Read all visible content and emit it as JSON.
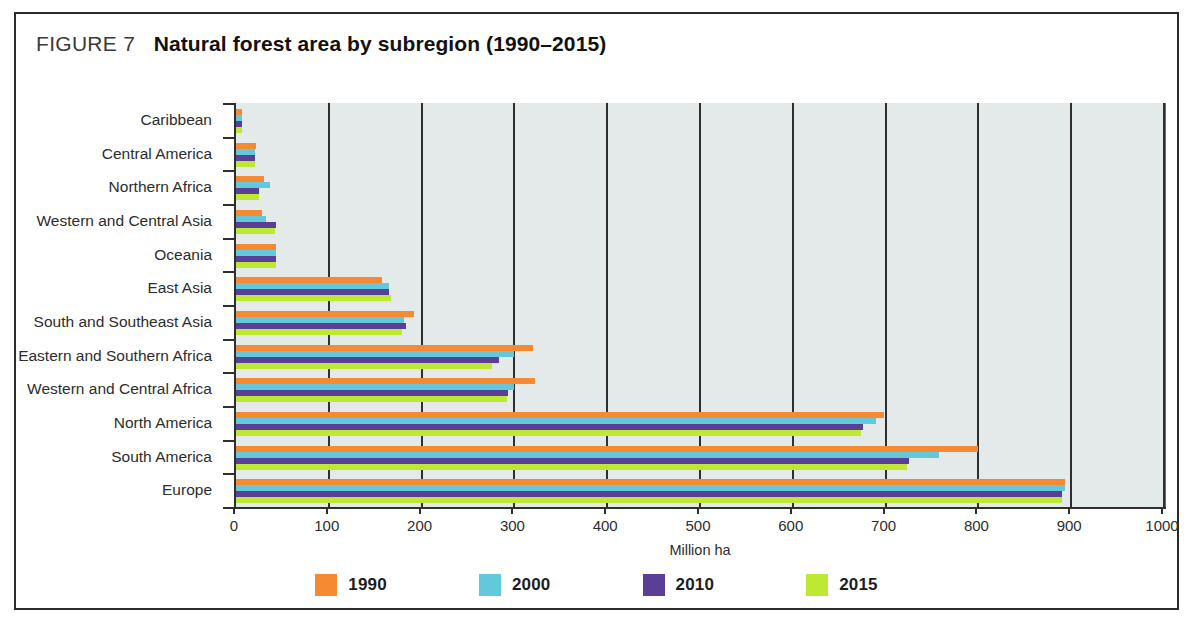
{
  "figure": {
    "number_label": "FIGURE 7",
    "title": "Natural forest area by subregion (1990–2015)"
  },
  "chart_data": {
    "type": "bar",
    "orientation": "horizontal",
    "title": "Natural forest area by subregion (1990–2015)",
    "xlabel": "Million ha",
    "ylabel": "",
    "xlim": [
      0,
      1000
    ],
    "xticks": [
      0,
      100,
      200,
      300,
      400,
      500,
      600,
      700,
      800,
      900,
      1000
    ],
    "grid": "vertical",
    "legend_position": "bottom",
    "categories": [
      "Caribbean",
      "Central America",
      "Northern Africa",
      "Western and Central Asia",
      "Oceania",
      "East Asia",
      "South and Southeast Asia",
      "Eastern and Southern Africa",
      "Western and Central Africa",
      "North America",
      "South America",
      "Europe"
    ],
    "series": [
      {
        "name": "1990",
        "color": "#F68A33",
        "values": [
          7,
          22,
          30,
          28,
          43,
          157,
          192,
          320,
          322,
          698,
          800,
          893
        ]
      },
      {
        "name": "2000",
        "color": "#63C8DC",
        "values": [
          6,
          21,
          37,
          32,
          43,
          165,
          181,
          300,
          300,
          690,
          758,
          893
        ]
      },
      {
        "name": "2010",
        "color": "#5B3E96",
        "values": [
          6,
          21,
          25,
          43,
          43,
          165,
          183,
          283,
          293,
          676,
          725,
          890
        ]
      },
      {
        "name": "2015",
        "color": "#BDE834",
        "values": [
          6,
          21,
          25,
          42,
          43,
          167,
          179,
          276,
          292,
          674,
          723,
          890
        ]
      }
    ]
  },
  "colors": {
    "plot_background": "#e4eaea",
    "axis": "#2f2f2f",
    "figure_border": "#2b2b2b"
  }
}
